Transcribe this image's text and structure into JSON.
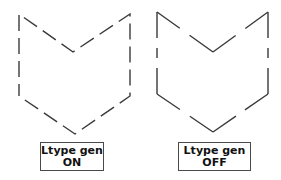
{
  "figure": {
    "stroke_color": "#3a3a3a",
    "panels": [
      {
        "id": "on",
        "label_line1": "Ltype gen",
        "label_line2": "ON",
        "dash_pattern": "continuous-across-vertices",
        "polyline_points": "19,96 19,14 73,52 130,14 130,96 75,134 19,96",
        "dasharray": "16 7"
      },
      {
        "id": "off",
        "label_line1": "Ltype gen",
        "label_line2": "OFF",
        "dash_pattern": "restarts-at-each-vertex",
        "segments": [
          "157,94 157,12",
          "157,12 213,52",
          "213,52 268,12",
          "268,12 268,94",
          "268,94 213,132",
          "213,132 157,94"
        ],
        "dasharray": "26 10 6 10"
      }
    ]
  }
}
